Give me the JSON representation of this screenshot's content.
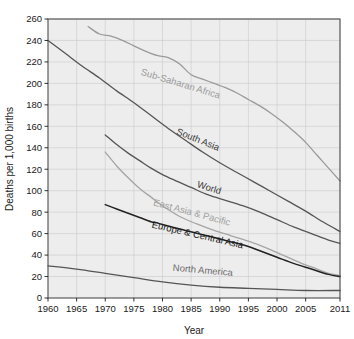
{
  "chart_data": {
    "type": "line",
    "title": "",
    "xlabel": "Year",
    "ylabel": "Deaths per 1,000 births",
    "xlim": [
      1960,
      2011
    ],
    "ylim": [
      0,
      260
    ],
    "grid": true,
    "legend_position": "inline-curve-labels",
    "xticks": [
      1960,
      1965,
      1970,
      1975,
      1980,
      1985,
      1990,
      1995,
      2000,
      2005,
      2011
    ],
    "yticks": [
      0,
      20,
      40,
      60,
      80,
      100,
      120,
      140,
      160,
      180,
      200,
      220,
      240,
      260
    ],
    "series": [
      {
        "name": "Sub-Saharan Africa",
        "color": "#9a9a9a",
        "label_color": "#9a9a9a",
        "x": [
          1967,
          1969,
          1971,
          1973,
          1975,
          1977,
          1979,
          1981,
          1983,
          1985,
          1987,
          1989,
          1991,
          1993,
          1995,
          1997,
          1999,
          2001,
          2003,
          2005,
          2007,
          2009,
          2011
        ],
        "y": [
          253,
          246,
          244,
          240,
          235,
          230,
          226,
          224,
          218,
          208,
          204,
          200,
          196,
          191,
          185,
          179,
          172,
          164,
          155,
          145,
          133,
          121,
          109
        ]
      },
      {
        "name": "South Asia",
        "color": "#555555",
        "label_color": "#3a3a3a",
        "x": [
          1960,
          1963,
          1966,
          1969,
          1972,
          1975,
          1978,
          1981,
          1984,
          1987,
          1990,
          1993,
          1996,
          1999,
          2002,
          2005,
          2008,
          2011
        ],
        "y": [
          240,
          228,
          216,
          205,
          193,
          182,
          170,
          158,
          147,
          136,
          126,
          117,
          108,
          99,
          90,
          81,
          71,
          62
        ]
      },
      {
        "name": "World",
        "color": "#555555",
        "label_color": "#3a3a3a",
        "x": [
          1970,
          1972,
          1974,
          1976,
          1978,
          1980,
          1982,
          1985,
          1988,
          1991,
          1994,
          1997,
          2000,
          2003,
          2006,
          2009,
          2011
        ],
        "y": [
          152,
          143,
          135,
          128,
          121,
          115,
          110,
          103,
          96,
          91,
          86,
          80,
          73,
          66,
          60,
          54,
          51
        ]
      },
      {
        "name": "East Asia & Pacific",
        "color": "#a5a5a5",
        "label_color": "#a0a0a0",
        "x": [
          1970,
          1972,
          1974,
          1976,
          1978,
          1980,
          1983,
          1986,
          1989,
          1992,
          1995,
          1998,
          2001,
          2004,
          2007,
          2009,
          2011
        ],
        "y": [
          136,
          123,
          112,
          102,
          94,
          86,
          76,
          69,
          63,
          58,
          53,
          47,
          40,
          33,
          27,
          23,
          21
        ]
      },
      {
        "name": "Europe & Central Asia",
        "color": "#222222",
        "label_color": "#1a1a1a",
        "x": [
          1970,
          1972,
          1974,
          1976,
          1978,
          1979,
          1981,
          1984,
          1987,
          1990,
          1993,
          1995,
          1997,
          2000,
          2003,
          2006,
          2009,
          2011
        ],
        "y": [
          87,
          83,
          79,
          75,
          71,
          70,
          67,
          63,
          59,
          55,
          51,
          48,
          44,
          38,
          32,
          27,
          22,
          20
        ]
      },
      {
        "name": "North America",
        "color": "#555555",
        "label_color": "#6b6b6b",
        "x": [
          1960,
          1965,
          1970,
          1975,
          1980,
          1985,
          1990,
          1995,
          2000,
          2005,
          2011
        ],
        "y": [
          30,
          27,
          23,
          19,
          15,
          12,
          10,
          9,
          8,
          7,
          7
        ]
      }
    ],
    "curve_labels": [
      {
        "text": "Sub-Saharan Africa",
        "x": 1983,
        "y": 197,
        "rotation": 17,
        "color": "#9a9a9a"
      },
      {
        "text": "South Asia",
        "x": 1986,
        "y": 145,
        "rotation": 22,
        "color": "#3a3a3a"
      },
      {
        "text": "World",
        "x": 1988,
        "y": 100,
        "rotation": 17,
        "color": "#3a3a3a"
      },
      {
        "text": "East Asia & Pacific",
        "x": 1985,
        "y": 77,
        "rotation": 15,
        "color": "#a0a0a0"
      },
      {
        "text": "Europe & Central Asia",
        "x": 1986,
        "y": 56,
        "rotation": 13,
        "color": "#1a1a1a"
      },
      {
        "text": "North America",
        "x": 1987,
        "y": 23,
        "rotation": 5,
        "color": "#6b6b6b"
      }
    ]
  }
}
